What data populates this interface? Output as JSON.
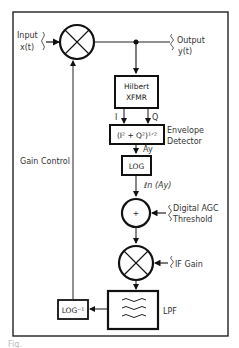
{
  "diagram": {
    "input_label": "Input",
    "input_signal": "x(t)",
    "output_label": "Output",
    "output_signal": "y(t)",
    "hilbert_line1": "Hilbert",
    "hilbert_line2": "XFMR",
    "i_label": "I",
    "q_label": "Q",
    "envelope_formula": "(I² + Q²)¹ᐟ²",
    "envelope_label1": "Envelope",
    "envelope_label2": "Detector",
    "ay_label": "Ay",
    "log_label": "LOG",
    "ln_label": "ℓn (Ay)",
    "summer_symbol": "+",
    "threshold_label1": "Digital AGC",
    "threshold_label2": "Threshold",
    "if_gain_label": "IF Gain",
    "lpf_label": "LPF",
    "log_inv_label": "LOG⁻¹",
    "gain_control_label": "Gain Control",
    "caption_fragment": "Fig."
  }
}
